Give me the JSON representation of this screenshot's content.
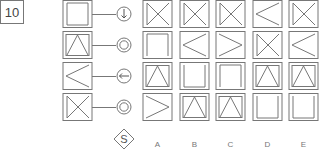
{
  "puzzle": {
    "number": "10",
    "question_label": "S",
    "colors": {
      "stroke": "#777777",
      "background": "#ffffff",
      "text": "#444444"
    },
    "left_column": [
      {
        "shape": "open-top-square",
        "symbol": "circle-arrow-down"
      },
      {
        "shape": "inverted-v-in-square",
        "symbol": "double-circle"
      },
      {
        "shape": "less-than-chevron",
        "symbol": "circle-arrow-left"
      },
      {
        "shape": "bowtie-left-bar",
        "symbol": "double-circle"
      }
    ],
    "options": [
      {
        "label": "A",
        "cells": [
          "bowtie-left-bar",
          "open-top-square",
          "inverted-v-in-square",
          "greater-than-chevron"
        ]
      },
      {
        "label": "B",
        "cells": [
          "bowtie-left-bar",
          "less-than-chevron",
          "open-top-square-u",
          "inverted-v-in-square"
        ]
      },
      {
        "label": "C",
        "cells": [
          "bowtie-left-bar",
          "greater-than-chevron",
          "open-bottom-square",
          "inverted-v-in-square"
        ]
      },
      {
        "label": "D",
        "cells": [
          "less-than-chevron",
          "bowtie-left-bar",
          "inverted-v-in-square",
          "open-top-square-u"
        ]
      },
      {
        "label": "E",
        "cells": [
          "bowtie-left-bar",
          "less-than-chevron",
          "inverted-v-in-square",
          "open-top-square-u"
        ]
      }
    ]
  }
}
